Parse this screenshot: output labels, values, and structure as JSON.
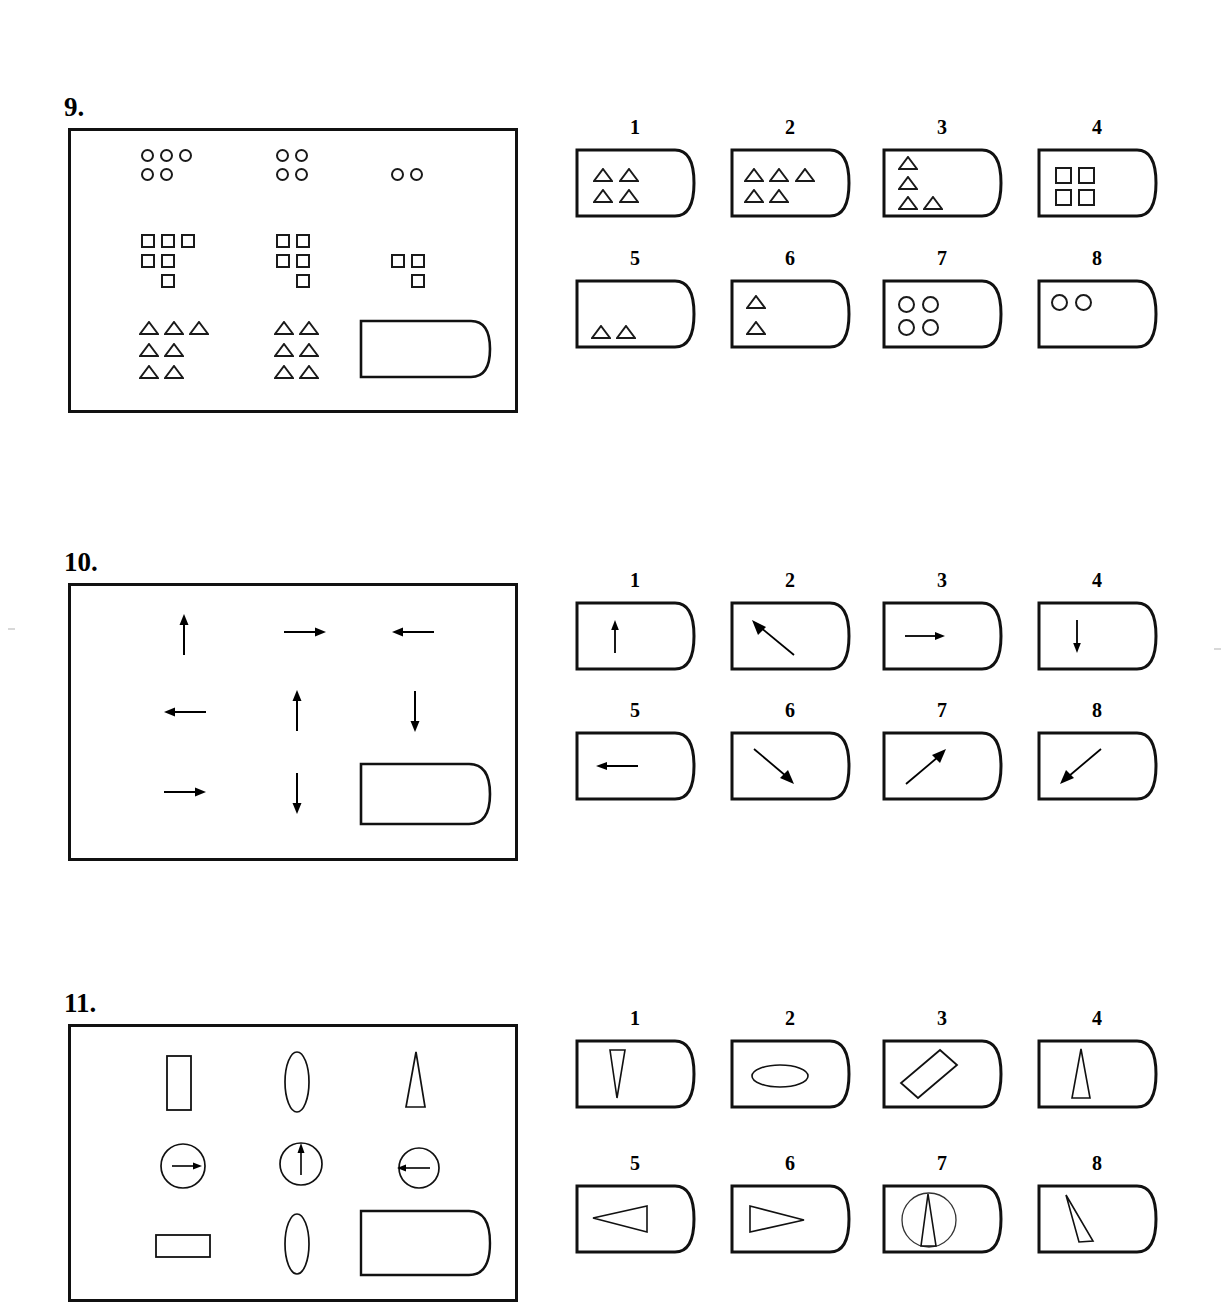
{
  "page": {
    "kind": "nonverbal-reasoning-matrix-worksheet",
    "width": 1226,
    "height": 1286,
    "background": "#ffffff",
    "ink": "#111111"
  },
  "problems": [
    {
      "number": "9.",
      "number_pos": {
        "x": 64,
        "y": 92
      },
      "frame": {
        "x": 68,
        "y": 128,
        "w": 450,
        "h": 285
      },
      "matrix": {
        "rows": 3,
        "cols": 3,
        "description": "Counts of small shapes decrease across each row; bottom-right cell is the missing answer tag.",
        "cells": [
          {
            "row": 1,
            "col": 1,
            "shape": "circle",
            "layout": [
              3,
              2
            ],
            "count": 5
          },
          {
            "row": 1,
            "col": 2,
            "shape": "circle",
            "layout": [
              2,
              2
            ],
            "count": 4
          },
          {
            "row": 1,
            "col": 3,
            "shape": "circle",
            "layout": [
              2
            ],
            "count": 2
          },
          {
            "row": 2,
            "col": 1,
            "shape": "square",
            "layout": [
              3,
              2,
              1
            ],
            "count": 6
          },
          {
            "row": 2,
            "col": 2,
            "shape": "square",
            "layout": [
              2,
              2,
              1
            ],
            "count": 5
          },
          {
            "row": 2,
            "col": 3,
            "shape": "square",
            "layout": [
              2,
              1
            ],
            "count": 3
          },
          {
            "row": 3,
            "col": 1,
            "shape": "triangle",
            "layout": [
              3,
              2,
              2
            ],
            "count": 7
          },
          {
            "row": 3,
            "col": 2,
            "shape": "triangle",
            "layout": [
              2,
              2,
              2
            ],
            "count": 6
          },
          {
            "row": 3,
            "col": 3,
            "shape": "answer-tag",
            "layout": [],
            "count": 0
          }
        ]
      },
      "options": [
        {
          "label": "1",
          "shape": "triangle",
          "layout": [
            2,
            2
          ],
          "count": 4
        },
        {
          "label": "2",
          "shape": "triangle",
          "layout": [
            3,
            2
          ],
          "count": 5
        },
        {
          "label": "3",
          "shape": "triangle",
          "layout": [
            1,
            1,
            2
          ],
          "count": 4
        },
        {
          "label": "4",
          "shape": "square",
          "layout": [
            2,
            2
          ],
          "count": 4
        },
        {
          "label": "5",
          "shape": "triangle",
          "layout": [
            2
          ],
          "count": 2,
          "align": "bottom"
        },
        {
          "label": "6",
          "shape": "triangle",
          "layout": [
            1,
            1
          ],
          "count": 2
        },
        {
          "label": "7",
          "shape": "circle",
          "layout": [
            2,
            2
          ],
          "count": 4
        },
        {
          "label": "8",
          "shape": "circle",
          "layout": [
            2
          ],
          "count": 2,
          "align": "top"
        }
      ]
    },
    {
      "number": "10.",
      "number_pos": {
        "x": 64,
        "y": 547
      },
      "frame": {
        "x": 68,
        "y": 583,
        "w": 450,
        "h": 278
      },
      "matrix": {
        "rows": 3,
        "cols": 3,
        "description": "Arrow directions per cell; bottom-right cell is the missing answer tag.",
        "cells": [
          {
            "row": 1,
            "col": 1,
            "shape": "arrow",
            "direction": "up"
          },
          {
            "row": 1,
            "col": 2,
            "shape": "arrow",
            "direction": "right"
          },
          {
            "row": 1,
            "col": 3,
            "shape": "arrow",
            "direction": "left"
          },
          {
            "row": 2,
            "col": 1,
            "shape": "arrow",
            "direction": "left"
          },
          {
            "row": 2,
            "col": 2,
            "shape": "arrow",
            "direction": "up"
          },
          {
            "row": 2,
            "col": 3,
            "shape": "arrow",
            "direction": "down"
          },
          {
            "row": 3,
            "col": 1,
            "shape": "arrow",
            "direction": "right"
          },
          {
            "row": 3,
            "col": 2,
            "shape": "arrow",
            "direction": "down"
          },
          {
            "row": 3,
            "col": 3,
            "shape": "answer-tag"
          }
        ]
      },
      "options": [
        {
          "label": "1",
          "shape": "arrow",
          "direction": "up"
        },
        {
          "label": "2",
          "shape": "arrow",
          "direction": "up-left"
        },
        {
          "label": "3",
          "shape": "arrow",
          "direction": "right"
        },
        {
          "label": "4",
          "shape": "arrow",
          "direction": "down"
        },
        {
          "label": "5",
          "shape": "arrow",
          "direction": "left"
        },
        {
          "label": "6",
          "shape": "arrow",
          "direction": "down-right"
        },
        {
          "label": "7",
          "shape": "arrow",
          "direction": "up-right"
        },
        {
          "label": "8",
          "shape": "arrow",
          "direction": "down-left"
        }
      ]
    },
    {
      "number": "11.",
      "number_pos": {
        "x": 64,
        "y": 988
      },
      "frame": {
        "x": 68,
        "y": 1024,
        "w": 450,
        "h": 278,
        "clipped_bottom": true
      },
      "matrix": {
        "rows": 3,
        "cols": 3,
        "description": "Outline figures: tall rectangle / tall ellipse / tall triangle, then circles with internal arrows, then wide rectangle / tall ellipse / answer tag.",
        "cells": [
          {
            "row": 1,
            "col": 1,
            "shape": "rect-vertical"
          },
          {
            "row": 1,
            "col": 2,
            "shape": "ellipse-vertical"
          },
          {
            "row": 1,
            "col": 3,
            "shape": "triangle-tall-up"
          },
          {
            "row": 2,
            "col": 1,
            "shape": "circle-arrow-right"
          },
          {
            "row": 2,
            "col": 2,
            "shape": "circle-arrow-up"
          },
          {
            "row": 2,
            "col": 3,
            "shape": "circle-arrow-left"
          },
          {
            "row": 3,
            "col": 1,
            "shape": "rect-horizontal"
          },
          {
            "row": 3,
            "col": 2,
            "shape": "ellipse-vertical"
          },
          {
            "row": 3,
            "col": 3,
            "shape": "answer-tag"
          }
        ]
      },
      "options": [
        {
          "label": "1",
          "shape": "triangle-thin-down"
        },
        {
          "label": "2",
          "shape": "ellipse-horizontal"
        },
        {
          "label": "3",
          "shape": "rect-diagonal"
        },
        {
          "label": "4",
          "shape": "triangle-tall-up"
        },
        {
          "label": "5",
          "shape": "triangle-pointing-left"
        },
        {
          "label": "6",
          "shape": "triangle-pointing-right"
        },
        {
          "label": "7",
          "shape": "triangle-in-circle"
        },
        {
          "label": "8",
          "shape": "triangle-tilted"
        }
      ]
    }
  ],
  "option_layout": {
    "card_w": 120,
    "card_h": 68,
    "col_x": [
      575,
      730,
      882,
      1037
    ],
    "row_offsets": [
      36,
      166
    ],
    "num_dy": -28
  }
}
